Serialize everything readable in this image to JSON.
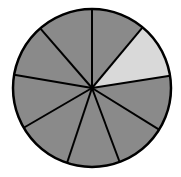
{
  "diagram": {
    "type": "fraction-circle",
    "total_sectors": 9,
    "shaded_sectors": 8,
    "unshaded_sectors": 1,
    "colors": {
      "shaded": "#8a8a8a",
      "unshaded": "#d9d9d9",
      "outline": "#000000"
    },
    "center": [
      92,
      88
    ],
    "radius": 79,
    "sector_boundary_endpoints": [
      [
        92,
        9
      ],
      [
        142,
        28
      ],
      [
        168,
        76
      ],
      [
        158,
        129
      ],
      [
        120,
        163
      ],
      [
        67,
        163
      ],
      [
        25,
        127
      ],
      [
        15,
        75
      ],
      [
        40,
        28
      ]
    ],
    "highlighted_sector_index": 1
  }
}
